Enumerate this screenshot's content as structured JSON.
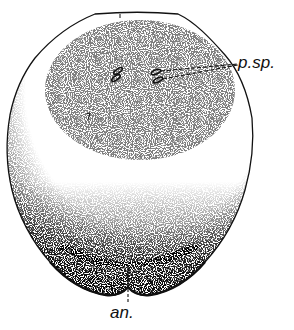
{
  "figure": {
    "labels": [
      {
        "id": "psp",
        "text": "p.sp.",
        "meaning": "points of the pair of spots indicated"
      },
      {
        "id": "an",
        "text": "an."
      }
    ]
  },
  "colors": {
    "ink": "#111111",
    "background": "#ffffff"
  }
}
